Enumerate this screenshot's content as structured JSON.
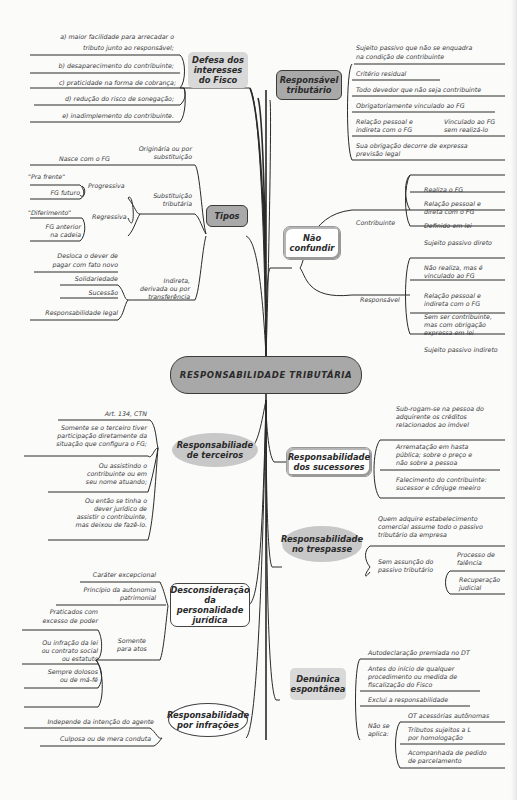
{
  "title": "RESPONSABILIDADE TRIBUTÁRIA",
  "colors": {
    "background": "#fbfbfa",
    "center_fill": "#a8a8a8",
    "node_grey": "#d9d9d9",
    "node_dark": "#a9a9a9",
    "line": "#2a2a2a"
  },
  "left": {
    "defesa": {
      "label_lines": [
        "Defesa dos",
        "interesses",
        "do Fisco"
      ],
      "items": [
        "a) maior facilidade para arrecadar o",
        "tributo junto ao responsável;",
        "b) desaparecimento do contribuinte;",
        "c) praticidade na forma de cobrança;",
        "d) redução do risco de sonegação;",
        "e) inadimplemento do contribuinte."
      ]
    },
    "tipos": {
      "label": "Tipos",
      "originaria": {
        "label_lines": [
          "Originária ou por",
          "substituição"
        ],
        "child": "Nasce com o FG"
      },
      "substituicao": {
        "label_lines": [
          "Substituição",
          "tributária"
        ],
        "progressiva": {
          "label": "Progressiva",
          "children": [
            "\"Pra frente\"",
            "FG futuro"
          ]
        },
        "regressiva": {
          "label": "Regressiva",
          "children": [
            "\"Diferimento\"",
            "FG anterior",
            "na cadeia"
          ]
        }
      },
      "indireta": {
        "label_lines": [
          "Indireta,",
          "derivada ou por",
          "transferência"
        ],
        "children": [
          "Desloca o dever de",
          "pagar com fato novo",
          "Solidariedade",
          "Sucessão",
          "Responsabilidade legal"
        ]
      }
    },
    "terceiros": {
      "label_lines": [
        "Responsabiliade",
        "de terceiros"
      ],
      "items": [
        "Art. 134, CTN",
        "Somente se o terceiro tiver",
        "participação diretamente da",
        "situação que configura o FG;",
        "Ou assistindo o",
        "contribuinte ou em",
        "seu nome atuando;",
        "Ou então se tinha o",
        "dever jurídico de",
        "assistir o contribuinte,",
        "mas deixou de fazê-lo."
      ]
    },
    "desconsideracao": {
      "label_lines": [
        "Desconsideração",
        "da personalidade",
        "jurídica"
      ],
      "items": [
        "Caráter excepcional",
        "Princípio da autonomia",
        "patrimonial"
      ],
      "somente": {
        "label_lines": [
          "Somente",
          "para atos"
        ],
        "children": [
          "Praticados com",
          "excesso de poder",
          "Ou infração da lei",
          "ou contrato social",
          "ou estatuto",
          "Sempre dolosos",
          "ou de má-fé"
        ]
      }
    },
    "infracoes": {
      "label_lines": [
        "Responsabilidade",
        "por infrações"
      ],
      "items": [
        "Independe da intenção do agente",
        "Culposa ou de mera conduta"
      ]
    }
  },
  "right": {
    "responsavel": {
      "label_lines": [
        "Responsável",
        "tributário"
      ],
      "items": [
        "Sujeito passivo que não se enquadra",
        "na condição de contribuinte",
        "Critério residual",
        "Todo devedor que não seja contribuinte",
        "Obrigatoriamente vinculado ao FG",
        "Relação pessoal e",
        "indireta com o FG",
        "Vinculado ao FG",
        "sem realizá-lo",
        "Sua obrigação decorre de expressa",
        "previsão legal"
      ]
    },
    "nao_confundir": {
      "label_lines": [
        "Não",
        "confundir"
      ],
      "contribuinte": {
        "label": "Contribuinte",
        "children": [
          "Realiza o FG",
          "Relação pessoal e",
          "direta com o FG",
          "Definido em lei",
          "Sujeito passivo direto"
        ]
      },
      "responsavel": {
        "label": "Responsável",
        "children": [
          "Não realiza, mas é",
          "vinculado ao FG",
          "Relação pessoal e",
          "indireta com o FG",
          "Sem ser contribuinte,",
          "mas com obrigação",
          "expressa em lei",
          "Sujeito passivo indireto"
        ]
      }
    },
    "sucessores": {
      "label_lines": [
        "Responsabilidade",
        "dos sucessores"
      ],
      "items": [
        "Sub-rogam-se na pessoa do",
        "adquirente os créditos",
        "relacionados ao imóvel",
        "Arrematação em hasta",
        "pública; sobre o preço e",
        "não sobre a pessoa",
        "Falecimento do contribuinte:",
        "sucessor e cônjuge meeiro"
      ]
    },
    "trespasse": {
      "label_lines": [
        "Responsabilidade",
        "no trespasse"
      ],
      "items": [
        "Quem adquire estabelecimento",
        "comercial assume todo o passivo",
        "tributário da empresa"
      ],
      "sem": {
        "label_lines": [
          "Sem assunção do",
          "passivo tributário"
        ],
        "children": [
          "Processo de",
          "falência",
          "Recuperação",
          "judicial"
        ]
      }
    },
    "denuncia": {
      "label_lines": [
        "Denúnica",
        "espontânea"
      ],
      "items": [
        "Autodeclaração premiada no DT",
        "Antes do início de qualquer",
        "procedimento ou medida de",
        "fiscalização do Fisco",
        "Exclui a responsabilidade"
      ],
      "nao_aplica": {
        "label_lines": [
          "Não se",
          "aplica:"
        ],
        "children": [
          "OT acessórias autônomas",
          "Tributos sujeitos a L",
          "por homologação",
          "Acompanhada de pedido",
          "de parcelamento"
        ]
      }
    }
  }
}
